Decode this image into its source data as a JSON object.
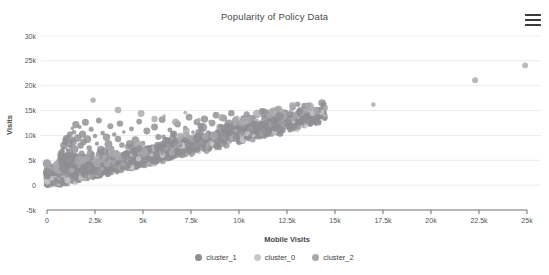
{
  "chart": {
    "title": "Popularity of Policy Data",
    "menu_icon": "hamburger-menu-icon",
    "watermark": "."
  },
  "legend": {
    "position": "bottom",
    "items": [
      {
        "label": "cluster_1",
        "color": "#8f8f92"
      },
      {
        "label": "cluster_0",
        "color": "#c9c9cc"
      },
      {
        "label": "cluster_2",
        "color": "#a9a9ad"
      }
    ]
  },
  "chart_data": {
    "type": "scatter",
    "title": "Popularity of Policy Data",
    "xlabel": "Mobile Visits",
    "ylabel": "Visits",
    "xlim": [
      0,
      25000
    ],
    "ylim": [
      -5000,
      30000
    ],
    "xticks": [
      0,
      2500,
      5000,
      7500,
      10000,
      12500,
      15000,
      17500,
      20000,
      22500,
      25000
    ],
    "xticklabels": [
      "0",
      "2.5k",
      "5k",
      "7.5k",
      "10k",
      "12.5k",
      "15k",
      "17.5k",
      "20k",
      "22.5k",
      "25k"
    ],
    "yticks": [
      -5000,
      0,
      5000,
      10000,
      15000,
      20000,
      25000,
      30000
    ],
    "yticklabels": [
      "-5k",
      "0",
      "5k",
      "10k",
      "15k",
      "20k",
      "25k",
      "30k"
    ],
    "grid": "horizontal",
    "series": [
      {
        "name": "cluster_1",
        "color": "#8f8f92",
        "points": [
          [
            120,
            350
          ],
          [
            160,
            520
          ],
          [
            190,
            700
          ],
          [
            210,
            430
          ],
          [
            240,
            880
          ],
          [
            260,
            1150
          ],
          [
            280,
            640
          ],
          [
            300,
            1420
          ],
          [
            320,
            980
          ],
          [
            340,
            1680
          ],
          [
            360,
            1230
          ],
          [
            380,
            2050
          ],
          [
            400,
            760
          ],
          [
            420,
            1890
          ],
          [
            440,
            2460
          ],
          [
            460,
            1340
          ],
          [
            480,
            2980
          ],
          [
            500,
            1720
          ],
          [
            520,
            3350
          ],
          [
            540,
            2210
          ],
          [
            560,
            3880
          ],
          [
            580,
            1460
          ],
          [
            600,
            4320
          ],
          [
            620,
            2640
          ],
          [
            640,
            4890
          ],
          [
            660,
            3120
          ],
          [
            680,
            5460
          ],
          [
            700,
            2380
          ],
          [
            720,
            5980
          ],
          [
            740,
            3640
          ],
          [
            760,
            6420
          ],
          [
            780,
            4180
          ],
          [
            800,
            6980
          ],
          [
            820,
            2940
          ],
          [
            840,
            7460
          ],
          [
            860,
            4620
          ],
          [
            880,
            7980
          ],
          [
            900,
            5240
          ],
          [
            920,
            8460
          ],
          [
            940,
            3820
          ],
          [
            960,
            8960
          ],
          [
            980,
            5680
          ],
          [
            1000,
            9420
          ],
          [
            1020,
            6180
          ],
          [
            1040,
            4360
          ],
          [
            1060,
            7120
          ],
          [
            1080,
            2860
          ],
          [
            1100,
            9860
          ],
          [
            1120,
            5920
          ],
          [
            1140,
            3480
          ],
          [
            1160,
            8240
          ],
          [
            1180,
            6640
          ],
          [
            1200,
            10280
          ],
          [
            1220,
            4920
          ],
          [
            1240,
            7680
          ],
          [
            1260,
            3260
          ],
          [
            1280,
            9180
          ],
          [
            1300,
            6080
          ],
          [
            1320,
            11420
          ],
          [
            1340,
            4480
          ],
          [
            1360,
            8620
          ],
          [
            1380,
            5380
          ],
          [
            1400,
            10640
          ],
          [
            1450,
            7240
          ],
          [
            1500,
            12180
          ],
          [
            1550,
            5840
          ],
          [
            1600,
            9460
          ],
          [
            1650,
            4260
          ],
          [
            1700,
            11680
          ],
          [
            1750,
            7980
          ],
          [
            1800,
            6380
          ],
          [
            1850,
            10240
          ],
          [
            1900,
            8680
          ],
          [
            1950,
            5180
          ],
          [
            2000,
            12640
          ],
          [
            2100,
            9240
          ],
          [
            2200,
            7480
          ],
          [
            2300,
            11240
          ],
          [
            2400,
            6280
          ],
          [
            2500,
            9880
          ],
          [
            2600,
            8340
          ],
          [
            2700,
            12980
          ],
          [
            2800,
            7140
          ],
          [
            2900,
            10480
          ],
          [
            3000,
            6840
          ],
          [
            3100,
            9640
          ],
          [
            3200,
            8240
          ],
          [
            3300,
            11840
          ],
          [
            3400,
            7480
          ],
          [
            3500,
            10180
          ],
          [
            3600,
            6480
          ],
          [
            3700,
            9280
          ],
          [
            3800,
            12380
          ],
          [
            3900,
            8080
          ],
          [
            4000,
            10680
          ],
          [
            4200,
            7680
          ],
          [
            4400,
            11280
          ],
          [
            4600,
            9080
          ],
          [
            4800,
            12780
          ],
          [
            5000,
            8480
          ],
          [
            5200,
            10880
          ],
          [
            5400,
            7280
          ],
          [
            5600,
            11680
          ],
          [
            5800,
            9680
          ],
          [
            6000,
            13180
          ],
          [
            6200,
            8880
          ],
          [
            6400,
            11080
          ],
          [
            6600,
            10280
          ],
          [
            6800,
            12280
          ],
          [
            7000,
            9480
          ],
          [
            7200,
            11480
          ],
          [
            7400,
            13680
          ],
          [
            7600,
            10680
          ],
          [
            7800,
            12680
          ],
          [
            8000,
            11880
          ],
          [
            8200,
            13280
          ],
          [
            8400,
            10480
          ],
          [
            8600,
            12480
          ],
          [
            8800,
            14080
          ],
          [
            9000,
            11680
          ],
          [
            9200,
            13480
          ],
          [
            9400,
            12080
          ],
          [
            9600,
            14480
          ],
          [
            9800,
            13080
          ],
          [
            10000,
            12480
          ],
          [
            10400,
            14280
          ],
          [
            10800,
            13680
          ],
          [
            11200,
            14880
          ],
          [
            11600,
            13980
          ],
          [
            12000,
            15280
          ],
          [
            12400,
            14480
          ],
          [
            12800,
            15680
          ],
          [
            13200,
            14980
          ],
          [
            13600,
            15880
          ],
          [
            14000,
            15380
          ],
          [
            14400,
            16180
          ]
        ]
      },
      {
        "name": "cluster_0",
        "color": "#c9c9cc",
        "points": [
          [
            140,
            240
          ],
          [
            180,
            180
          ],
          [
            220,
            320
          ],
          [
            270,
            260
          ],
          [
            310,
            420
          ],
          [
            350,
            340
          ],
          [
            390,
            480
          ],
          [
            430,
            380
          ],
          [
            470,
            560
          ],
          [
            510,
            440
          ],
          [
            550,
            640
          ],
          [
            590,
            520
          ],
          [
            630,
            720
          ],
          [
            670,
            580
          ],
          [
            710,
            820
          ],
          [
            750,
            660
          ],
          [
            790,
            920
          ],
          [
            830,
            740
          ],
          [
            870,
            1020
          ],
          [
            910,
            840
          ],
          [
            950,
            1140
          ],
          [
            990,
            940
          ],
          [
            1030,
            1240
          ],
          [
            1070,
            1040
          ],
          [
            1110,
            1340
          ],
          [
            1150,
            1140
          ],
          [
            1190,
            1460
          ],
          [
            1230,
            1240
          ],
          [
            1270,
            1560
          ],
          [
            1310,
            1360
          ],
          [
            1350,
            1680
          ],
          [
            1390,
            1460
          ],
          [
            1430,
            1780
          ],
          [
            1470,
            1580
          ],
          [
            1510,
            1880
          ],
          [
            1550,
            1680
          ],
          [
            1590,
            1980
          ],
          [
            1630,
            1780
          ],
          [
            1670,
            2080
          ],
          [
            1710,
            1880
          ],
          [
            1750,
            2180
          ],
          [
            1790,
            1980
          ],
          [
            1830,
            2280
          ],
          [
            1870,
            2080
          ],
          [
            1910,
            2380
          ],
          [
            1950,
            2180
          ],
          [
            2000,
            2480
          ],
          [
            2060,
            2280
          ],
          [
            2120,
            2580
          ],
          [
            2180,
            2380
          ],
          [
            2240,
            2680
          ],
          [
            2300,
            2480
          ],
          [
            2360,
            2780
          ],
          [
            2420,
            2580
          ],
          [
            2480,
            2880
          ],
          [
            2540,
            2680
          ],
          [
            2600,
            2980
          ],
          [
            2660,
            2780
          ],
          [
            2720,
            3080
          ],
          [
            2780,
            2880
          ],
          [
            2840,
            3180
          ],
          [
            2900,
            2980
          ],
          [
            2960,
            3280
          ],
          [
            3020,
            3080
          ],
          [
            3100,
            3380
          ],
          [
            3200,
            3180
          ],
          [
            3300,
            3480
          ],
          [
            3400,
            3280
          ],
          [
            3500,
            3580
          ],
          [
            3600,
            3380
          ],
          [
            3700,
            3680
          ],
          [
            3800,
            3480
          ],
          [
            3900,
            3780
          ],
          [
            4000,
            3580
          ],
          [
            4100,
            3880
          ],
          [
            4200,
            3680
          ],
          [
            4300,
            3980
          ],
          [
            4400,
            3780
          ],
          [
            4500,
            4080
          ],
          [
            4600,
            3880
          ],
          [
            4700,
            4180
          ],
          [
            4800,
            3980
          ],
          [
            4900,
            4280
          ],
          [
            5000,
            4080
          ]
        ]
      },
      {
        "name": "cluster_2",
        "color": "#a9a9ad",
        "points": [
          [
            2400,
            17100
          ],
          [
            3700,
            15100
          ],
          [
            4900,
            14400
          ],
          [
            5600,
            13300
          ],
          [
            6100,
            13900
          ],
          [
            6700,
            12700
          ],
          [
            7200,
            14600
          ],
          [
            7900,
            13100
          ],
          [
            8500,
            12800
          ],
          [
            9100,
            13600
          ],
          [
            9700,
            12900
          ],
          [
            10300,
            13800
          ],
          [
            10900,
            12600
          ],
          [
            11500,
            14100
          ],
          [
            12100,
            13300
          ],
          [
            12700,
            14800
          ],
          [
            13300,
            13900
          ],
          [
            13900,
            15100
          ],
          [
            17000,
            16200
          ],
          [
            22300,
            21100
          ],
          [
            24900,
            24100
          ]
        ]
      }
    ]
  }
}
